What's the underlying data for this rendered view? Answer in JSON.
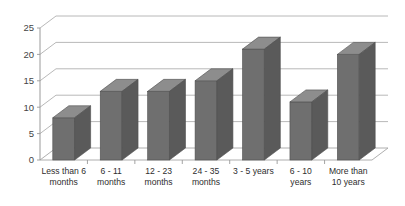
{
  "chart_data": {
    "type": "bar",
    "title": "",
    "subtitle": "",
    "xlabel": "",
    "ylabel": "",
    "categories": [
      "Less than 6 months",
      "6 - 11 months",
      "12 - 23 months",
      "24 - 35 months",
      "3 - 5 years",
      "6 - 10 years",
      "More than 10 years"
    ],
    "category_lines": [
      [
        "Less than 6",
        "months"
      ],
      [
        "6 - 11",
        "months"
      ],
      [
        "12 - 23",
        "months"
      ],
      [
        "24 - 35",
        "months"
      ],
      [
        "3 - 5 years",
        ""
      ],
      [
        "6 - 10",
        "years"
      ],
      [
        "More than",
        "10 years"
      ]
    ],
    "values": [
      8,
      13,
      13,
      15,
      21,
      11,
      20
    ],
    "ylim": [
      0,
      25
    ],
    "yticks": [
      0,
      5,
      10,
      15,
      20,
      25
    ],
    "ytick_labels": [
      "0",
      "5",
      "10",
      "15",
      "20",
      "25"
    ],
    "grid": true,
    "grid_orientation": "horizontal",
    "legend": false,
    "legend_position": "none",
    "style": "3d-column",
    "colors": {
      "bar_front": "#6f6f6f",
      "bar_top": "#8d8d8d",
      "bar_side": "#5a5a5a",
      "bar_outline": "#4f4f4f",
      "grid": "#b0b0b0",
      "axis": "#9a9a9a",
      "text": "#3a3a3a",
      "background": "#ffffff"
    }
  }
}
